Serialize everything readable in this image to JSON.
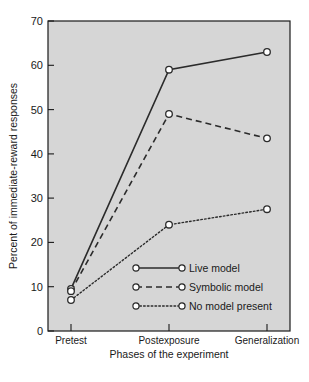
{
  "chart_data": {
    "type": "line",
    "title": "",
    "xlabel": "Phases of the experiment",
    "ylabel": "Percent of immediate-reward responses",
    "categories": [
      "Pretest",
      "Postexposure",
      "Generalization"
    ],
    "ylim": [
      0,
      70
    ],
    "yticks": [
      0,
      10,
      20,
      30,
      40,
      50,
      60,
      70
    ],
    "ytick_labels": [
      "0",
      "10",
      "20",
      "30",
      "40",
      "50",
      "60",
      "70"
    ],
    "grid": false,
    "legend_position": "lower-right-inside",
    "series": [
      {
        "name": "Live model",
        "style": "solid",
        "marker": "open-circle",
        "values": [
          9.5,
          59,
          63
        ]
      },
      {
        "name": "Symbolic model",
        "style": "dashed",
        "marker": "open-circle",
        "values": [
          9,
          49,
          43.5
        ]
      },
      {
        "name": "No model present",
        "style": "dotted",
        "marker": "open-circle",
        "values": [
          7,
          24,
          27.5
        ]
      }
    ]
  },
  "colors": {
    "plot_background": "#d6d6d6",
    "page_background": "#ffffff",
    "axis": "#1a1a1a",
    "line": "#2b2b2b",
    "marker_fill": "#ffffff",
    "text": "#1a1a1a"
  },
  "axes": {
    "y_tick_0": "0",
    "y_tick_10": "10",
    "y_tick_20": "20",
    "y_tick_30": "30",
    "y_tick_40": "40",
    "y_tick_50": "50",
    "y_tick_60": "60",
    "y_tick_70": "70",
    "y_axis_title": "Percent of immediate-reward responses",
    "x_axis_title": "Phases of the experiment",
    "x_cat_1": "Pretest",
    "x_cat_2": "Postexposure",
    "x_cat_3": "Generalization"
  },
  "legend": {
    "entry_1": "Live model",
    "entry_2": "Symbolic model",
    "entry_3": "No model present"
  }
}
